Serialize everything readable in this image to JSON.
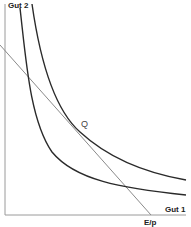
{
  "diagram": {
    "type": "indifference-curve-budget-line",
    "labels": {
      "y_axis": "Gut 2",
      "x_axis": "Gut 1",
      "x_intercept": "E/p",
      "y_intercept": "E/",
      "tangency_point": "Q"
    },
    "elements": [
      {
        "name": "budget-line",
        "description": "straight line from y-axis intercept to x-axis intercept E/p"
      },
      {
        "name": "indifference-curve-inner",
        "description": "lower indifference curve cutting the budget line twice"
      },
      {
        "name": "indifference-curve-outer",
        "description": "higher indifference curve tangent to budget line at Q"
      }
    ],
    "colors": {
      "curve": "#2a2a2a",
      "budget_line": "#8a8a8a",
      "axis": "#9a9a9a"
    }
  }
}
